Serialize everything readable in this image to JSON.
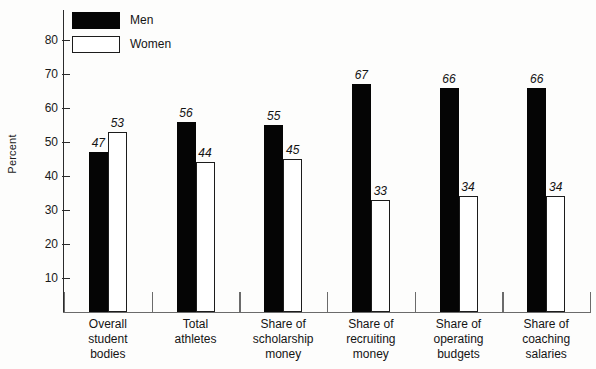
{
  "chart_data": {
    "type": "bar",
    "title": "",
    "xlabel": "",
    "ylabel": "Percent",
    "ylim": [
      0,
      85
    ],
    "yticks": [
      10,
      20,
      30,
      40,
      50,
      60,
      70,
      80
    ],
    "ytick_labels": [
      "10",
      "20",
      "30",
      "40",
      "50",
      "60",
      "70",
      "80"
    ],
    "grid": false,
    "legend_position": "top-left",
    "categories": [
      "Overall\nstudent\nbodies",
      "Total\nathletes",
      "Share of\nscholarship\nmoney",
      "Share of\nrecruiting\nmoney",
      "Share of\noperating\nbudgets",
      "Share of\ncoaching\nsalaries"
    ],
    "series": [
      {
        "name": "Men",
        "values": [
          47,
          56,
          55,
          67,
          66,
          66
        ]
      },
      {
        "name": "Women",
        "values": [
          53,
          44,
          45,
          33,
          34,
          34
        ]
      }
    ],
    "colors": {
      "men": "#050505",
      "women": "#ffffff",
      "women_border": "#1c1c1c",
      "axis": "#2b2b2b",
      "background": "#fdfdfc"
    }
  },
  "legend": {
    "items": [
      {
        "label": "Men",
        "swatch": "men"
      },
      {
        "label": "Women",
        "swatch": "women"
      }
    ]
  }
}
